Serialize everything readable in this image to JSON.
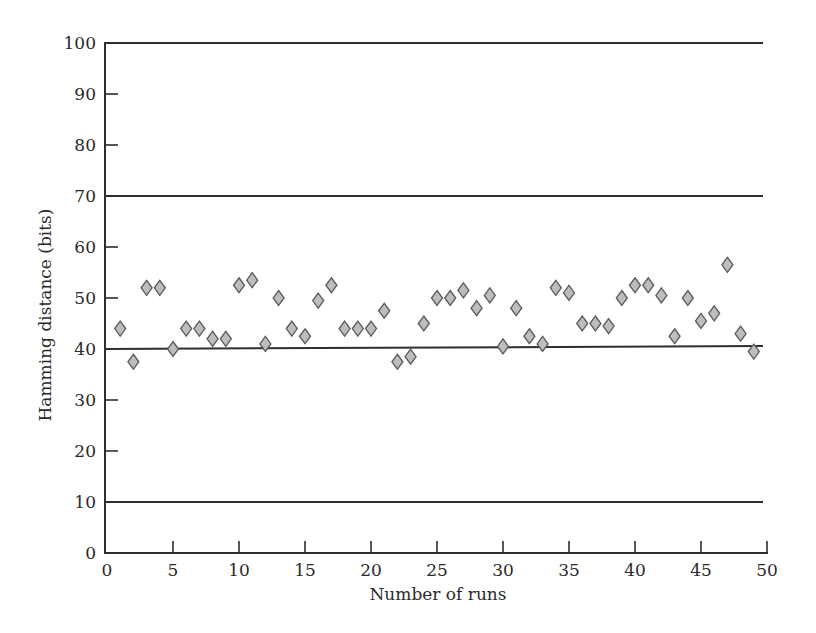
{
  "chart_data": {
    "type": "scatter",
    "title": "",
    "xlabel": "Number of runs",
    "ylabel": "Hamming distance (bits)",
    "xlim": [
      0,
      50
    ],
    "ylim": [
      0,
      100
    ],
    "x_ticks": [
      0,
      5,
      10,
      15,
      20,
      25,
      30,
      35,
      40,
      45,
      50
    ],
    "y_ticks": [
      0,
      10,
      20,
      30,
      40,
      50,
      60,
      70,
      80,
      90,
      100
    ],
    "grid": false,
    "legend": null,
    "reference_lines": [
      100,
      70,
      40,
      10
    ],
    "marker": "diamond",
    "marker_color": "#bdbdbd",
    "series": [
      {
        "name": "Hamming distance",
        "x": [
          1,
          2,
          3,
          4,
          5,
          6,
          7,
          8,
          9,
          10,
          11,
          12,
          13,
          14,
          15,
          16,
          17,
          18,
          19,
          20,
          21,
          22,
          23,
          24,
          25,
          26,
          27,
          28,
          29,
          30,
          31,
          32,
          33,
          34,
          35,
          36,
          37,
          38,
          39,
          40,
          41,
          42,
          43,
          44,
          45,
          46,
          47,
          48,
          49
        ],
        "y": [
          44,
          37.5,
          52,
          52,
          40,
          44,
          44,
          42,
          42,
          52.5,
          53.5,
          41,
          50,
          44,
          42.5,
          49.5,
          52.5,
          44,
          44,
          44,
          47.5,
          37.5,
          38.5,
          45,
          50,
          50,
          51.5,
          48,
          50.5,
          40.5,
          48,
          42.5,
          41,
          52,
          51,
          45,
          45,
          44.5,
          50,
          52.5,
          52.5,
          50.5,
          42.5,
          50,
          45.5,
          47,
          56.5,
          43,
          39.5
        ]
      }
    ]
  }
}
